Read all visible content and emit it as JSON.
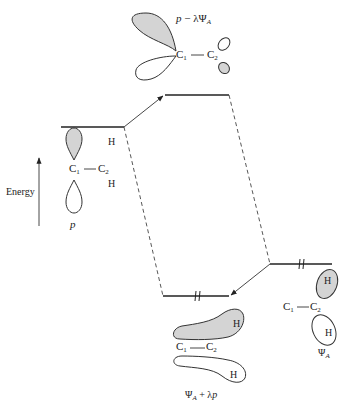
{
  "diagram": {
    "axis": {
      "label": "Energy",
      "direction": "up"
    },
    "orbitals": {
      "left": {
        "name": "p",
        "atoms": {
          "c1": "C",
          "c1_sub": "1",
          "c2": "C",
          "c2_sub": "2",
          "h_top": "H",
          "h_bottom": "H"
        },
        "label": "p"
      },
      "top": {
        "label_p": "p",
        "label_minus": " − λ",
        "label_psi": "Ψ",
        "label_sub": "A",
        "atoms": {
          "c1": "C",
          "c1_sub": "1",
          "c2": "C",
          "c2_sub": "2"
        }
      },
      "right": {
        "label_psi": "Ψ",
        "label_sub": "A",
        "atoms": {
          "c1": "C",
          "c1_sub": "1",
          "c2": "C",
          "c2_sub": "2",
          "h_top": "H",
          "h_bottom": "H"
        }
      },
      "bottom": {
        "label_psi": "Ψ",
        "label_sub": "A",
        "label_plus": " + λ",
        "label_p": "p",
        "atoms": {
          "c1": "C",
          "c1_sub": "1",
          "c2": "C",
          "c2_sub": "2",
          "h_top": "H",
          "h_bottom": "H"
        }
      }
    },
    "levels": [
      {
        "id": "p-level",
        "electrons": 0
      },
      {
        "id": "antibonding-level",
        "electrons": 0
      },
      {
        "id": "psiA-level",
        "electrons": 2
      },
      {
        "id": "bonding-level",
        "electrons": 2
      }
    ],
    "colors": {
      "shaded_lobe": "#d4d4d4",
      "line": "#222222"
    }
  }
}
